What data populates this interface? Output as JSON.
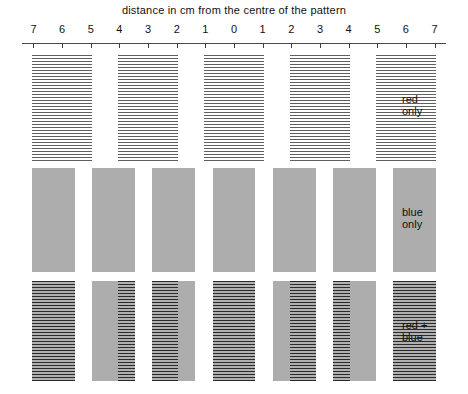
{
  "axis": {
    "title": "distance in cm from the centre of the pattern",
    "tick_labels": [
      "7",
      "6",
      "5",
      "4",
      "3",
      "2",
      "1",
      "0",
      "1",
      "2",
      "3",
      "4",
      "5",
      "6",
      "7"
    ],
    "tick_values": [
      -7,
      -6,
      -5,
      -4,
      -3,
      -2,
      -1,
      0,
      1,
      2,
      3,
      4,
      5,
      6,
      7
    ],
    "min": -7.4,
    "max": 7.4,
    "unit": "cm"
  },
  "labels": {
    "red_line1": "red",
    "red_line2": "only",
    "blue_line1": "blue",
    "blue_line2": "only",
    "both_line1": "red +",
    "both_line2": "blue"
  },
  "colors": {
    "stripe_dark": "#5f2b2b",
    "blue_wash": "#adadad",
    "overlap_dark": "#2b2b2b",
    "axis": "#4a4a4a",
    "text": "#111111",
    "background": "#ffffff"
  },
  "chart_data": {
    "type": "bar",
    "xlabel": "distance in cm from the centre of the pattern",
    "ylabel": "",
    "xlim": [
      -7.4,
      7.4
    ],
    "grid": false,
    "legend_position": "right",
    "series": [
      {
        "name": "red only",
        "fringe_spacing_cm": 3.0,
        "fringe_width_cm": 2.1,
        "centers_cm": [
          -6.0,
          -3.0,
          0.0,
          3.0,
          6.0
        ],
        "bands": [
          {
            "start_cm": -7.05,
            "end_cm": -4.95
          },
          {
            "start_cm": -4.05,
            "end_cm": -1.95
          },
          {
            "start_cm": -1.05,
            "end_cm": 1.05
          },
          {
            "start_cm": 1.95,
            "end_cm": 4.05
          },
          {
            "start_cm": 4.95,
            "end_cm": 7.05
          }
        ]
      },
      {
        "name": "blue only",
        "fringe_spacing_cm": 2.1,
        "fringe_width_cm": 1.5,
        "centers_cm": [
          -6.3,
          -4.2,
          -2.1,
          0.0,
          2.1,
          4.2,
          6.3
        ],
        "bands": [
          {
            "start_cm": -7.05,
            "end_cm": -5.55
          },
          {
            "start_cm": -4.95,
            "end_cm": -3.45
          },
          {
            "start_cm": -2.85,
            "end_cm": -1.35
          },
          {
            "start_cm": -0.75,
            "end_cm": 0.75
          },
          {
            "start_cm": 1.35,
            "end_cm": 2.85
          },
          {
            "start_cm": 3.45,
            "end_cm": 4.95
          },
          {
            "start_cm": 5.55,
            "end_cm": 7.05
          }
        ]
      },
      {
        "name": "red + blue",
        "description": "superposition of the red and blue fringe sets; regions where both overlap appear darkest",
        "red_bands": [
          {
            "start_cm": -7.05,
            "end_cm": -4.95
          },
          {
            "start_cm": -4.05,
            "end_cm": -1.95
          },
          {
            "start_cm": -1.05,
            "end_cm": 1.05
          },
          {
            "start_cm": 1.95,
            "end_cm": 4.05
          },
          {
            "start_cm": 4.95,
            "end_cm": 7.05
          }
        ],
        "blue_bands": [
          {
            "start_cm": -7.05,
            "end_cm": -5.55
          },
          {
            "start_cm": -4.95,
            "end_cm": -3.45
          },
          {
            "start_cm": -2.85,
            "end_cm": -1.35
          },
          {
            "start_cm": -0.75,
            "end_cm": 0.75
          },
          {
            "start_cm": 1.35,
            "end_cm": 2.85
          },
          {
            "start_cm": 3.45,
            "end_cm": 4.95
          },
          {
            "start_cm": 5.55,
            "end_cm": 7.05
          }
        ]
      }
    ]
  }
}
